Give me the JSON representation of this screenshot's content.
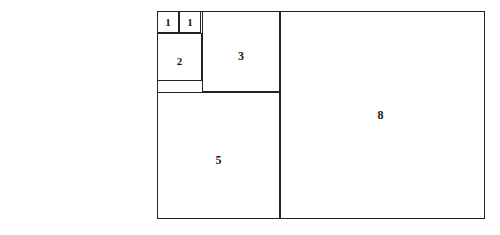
{
  "figure_set": {
    "title": "Fibonacci square tilings",
    "background_color": "#ffffff",
    "line_color": "#232323",
    "label_color": "#1a1a1a",
    "figures": [
      {
        "name": "left-tiling",
        "description": "Fibonacci rectangle composed of squares 1,1,2,3 with a 5-square below",
        "tiles": [
          {
            "label": "1",
            "name": "tile-one-a"
          },
          {
            "label": "1",
            "name": "tile-one-b"
          },
          {
            "label": "2",
            "name": "tile-two"
          },
          {
            "label": "3",
            "name": "tile-three"
          },
          {
            "label": "5",
            "name": "tile-five"
          }
        ]
      },
      {
        "name": "right-tiling",
        "description": "Fibonacci rectangle composed of squares 1,1,2,3,5 with an 8-square at right",
        "tiles": [
          {
            "label": "1",
            "name": "tile-one-a"
          },
          {
            "label": "1",
            "name": "tile-one-b"
          },
          {
            "label": "2",
            "name": "tile-two"
          },
          {
            "label": "3",
            "name": "tile-three"
          },
          {
            "label": "5",
            "name": "tile-five"
          },
          {
            "label": "8",
            "name": "tile-eight"
          }
        ]
      }
    ]
  }
}
